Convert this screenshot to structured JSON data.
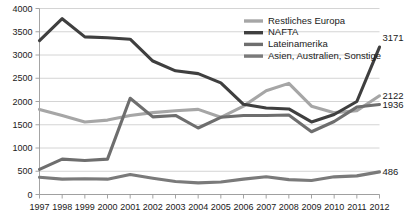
{
  "chart_data": {
    "type": "line",
    "title": "",
    "xlabel": "",
    "ylabel": "",
    "ylim": [
      0,
      4000
    ],
    "y_ticks": [
      0,
      500,
      1000,
      1500,
      2000,
      2500,
      3000,
      3500,
      4000
    ],
    "grid": true,
    "legend_position": "top-right",
    "categories": [
      "1997",
      "1998",
      "1999",
      "2000",
      "2001",
      "2002",
      "2003",
      "2004",
      "2005",
      "2006",
      "2007",
      "2008",
      "2009",
      "2010",
      "2011",
      "2012"
    ],
    "series": [
      {
        "name": "Restliches Europa",
        "color": "#a6a6a6",
        "end_label": "2122",
        "values": [
          1830,
          1700,
          1560,
          1600,
          1700,
          1760,
          1800,
          1830,
          1660,
          1900,
          2230,
          2390,
          1900,
          1760,
          1800,
          2122
        ]
      },
      {
        "name": "NAFTA",
        "color": "#3f3f3f",
        "end_label": "3171",
        "values": [
          3310,
          3780,
          3390,
          3370,
          3340,
          2870,
          2660,
          2600,
          2400,
          1940,
          1860,
          1840,
          1560,
          1720,
          2000,
          3171
        ]
      },
      {
        "name": "Lateinamerika",
        "color": "#6e6e6e",
        "end_label": "1936",
        "values": [
          540,
          760,
          730,
          760,
          2070,
          1670,
          1700,
          1430,
          1660,
          1700,
          1700,
          1710,
          1350,
          1570,
          1880,
          1936
        ]
      },
      {
        "name": "Asien, Australien, Sonstige",
        "color": "#7a7a7a",
        "end_label": "486",
        "values": [
          370,
          330,
          340,
          330,
          430,
          350,
          280,
          250,
          270,
          330,
          380,
          320,
          300,
          380,
          400,
          486
        ]
      }
    ],
    "end_labels": [
      "3171",
      "2122",
      "1936",
      "486"
    ]
  },
  "legend": {
    "items": [
      {
        "label": "Restliches Europa"
      },
      {
        "label": "NAFTA"
      },
      {
        "label": "Lateinamerika"
      },
      {
        "label": "Asien, Australien, Sonstige"
      }
    ]
  }
}
